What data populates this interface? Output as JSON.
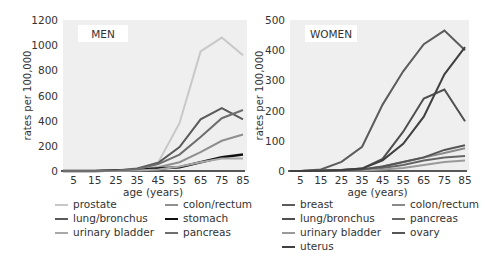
{
  "chart_data": [
    {
      "type": "line",
      "title": "MEN",
      "xlabel": "age (years)",
      "ylabel": "rates per 100,000",
      "x": [
        0,
        5,
        15,
        25,
        35,
        45,
        55,
        65,
        75,
        85
      ],
      "xticks": [
        "5",
        "15",
        "25",
        "35",
        "45",
        "55",
        "65",
        "75",
        "85"
      ],
      "yticks": [
        "0",
        "200",
        "400",
        "600",
        "800",
        "1000",
        "1200"
      ],
      "ylim": [
        0,
        1200
      ],
      "grid": false,
      "legend_position": "bottom",
      "series": [
        {
          "name": "prostate",
          "color": "#c8c8c8",
          "width": 2,
          "values": [
            0,
            0,
            0,
            2,
            10,
            70,
            380,
            950,
            1060,
            920
          ]
        },
        {
          "name": "colon/rectum",
          "color": "#8f8f8f",
          "width": 2,
          "values": [
            0,
            0,
            1,
            4,
            12,
            30,
            70,
            150,
            240,
            290
          ]
        },
        {
          "name": "lung/bronchus",
          "color": "#5a5a5a",
          "width": 2,
          "values": [
            0,
            0,
            1,
            5,
            20,
            65,
            190,
            410,
            500,
            410
          ]
        },
        {
          "name": "stomach",
          "color": "#111111",
          "width": 2.5,
          "values": [
            0,
            0,
            1,
            3,
            8,
            20,
            30,
            70,
            110,
            130
          ]
        },
        {
          "name": "urinary bladder",
          "color": "#a8a8a8",
          "width": 2,
          "values": [
            0,
            0,
            0,
            1,
            4,
            12,
            35,
            70,
            100,
            100
          ]
        },
        {
          "name": "pancreas",
          "color": "#6e6e6e",
          "width": 2,
          "values": [
            0,
            0,
            1,
            4,
            14,
            55,
            130,
            270,
            420,
            485
          ]
        }
      ]
    },
    {
      "type": "line",
      "title": "WOMEN",
      "xlabel": "age (years)",
      "ylabel": "rates per 100,000",
      "x": [
        0,
        5,
        15,
        25,
        35,
        45,
        55,
        65,
        75,
        85
      ],
      "xticks": [
        "5",
        "15",
        "25",
        "35",
        "45",
        "55",
        "65",
        "75",
        "85"
      ],
      "yticks": [
        "0",
        "100",
        "200",
        "300",
        "400",
        "500"
      ],
      "ylim": [
        0,
        500
      ],
      "grid": false,
      "legend_position": "bottom",
      "series": [
        {
          "name": "breast",
          "color": "#5c5c5c",
          "width": 2,
          "values": [
            0,
            0,
            5,
            30,
            80,
            220,
            330,
            420,
            465,
            400
          ]
        },
        {
          "name": "colon/rectum",
          "color": "#8a8a8a",
          "width": 2,
          "values": [
            0,
            0,
            1,
            3,
            5,
            15,
            30,
            45,
            60,
            75
          ]
        },
        {
          "name": "lung/bronchus",
          "color": "#4f4f4f",
          "width": 2,
          "values": [
            0,
            0,
            1,
            3,
            8,
            40,
            130,
            240,
            270,
            165
          ]
        },
        {
          "name": "pancreas",
          "color": "#666666",
          "width": 2,
          "values": [
            0,
            0,
            0,
            1,
            3,
            10,
            20,
            35,
            45,
            50
          ]
        },
        {
          "name": "urinary bladder",
          "color": "#9a9a9a",
          "width": 2,
          "values": [
            0,
            0,
            0,
            1,
            2,
            5,
            10,
            20,
            30,
            35
          ]
        },
        {
          "name": "ovary",
          "color": "#555555",
          "width": 2,
          "values": [
            0,
            0,
            1,
            2,
            5,
            15,
            30,
            45,
            70,
            85
          ]
        },
        {
          "name": "uterus",
          "color": "#404040",
          "width": 2,
          "values": [
            0,
            0,
            1,
            3,
            8,
            35,
            90,
            180,
            320,
            410
          ]
        }
      ]
    }
  ],
  "men": {
    "title": "MEN",
    "ylabel": "rates per 100,000",
    "xlabel": "age (years)",
    "legend": [
      {
        "label": "prostate",
        "color": "#c8c8c8"
      },
      {
        "label": "colon/rectum",
        "color": "#8f8f8f"
      },
      {
        "label": "lung/bronchus",
        "color": "#5a5a5a"
      },
      {
        "label": "stomach",
        "color": "#111111"
      },
      {
        "label": "urinary bladder",
        "color": "#a8a8a8"
      },
      {
        "label": "pancreas",
        "color": "#6e6e6e"
      }
    ]
  },
  "women": {
    "title": "WOMEN",
    "ylabel": "rates per 100,000",
    "xlabel": "age (years)",
    "legend": [
      {
        "label": "breast",
        "color": "#5c5c5c"
      },
      {
        "label": "colon/rectum",
        "color": "#8a8a8a"
      },
      {
        "label": "lung/bronchus",
        "color": "#4f4f4f"
      },
      {
        "label": "pancreas",
        "color": "#666666"
      },
      {
        "label": "urinary bladder",
        "color": "#9a9a9a"
      },
      {
        "label": "ovary",
        "color": "#555555"
      },
      {
        "label": "uterus",
        "color": "#404040"
      }
    ]
  },
  "colors": {
    "plot_bg": "#efefef",
    "axis": "#222222",
    "title_box": "#ffffff"
  }
}
